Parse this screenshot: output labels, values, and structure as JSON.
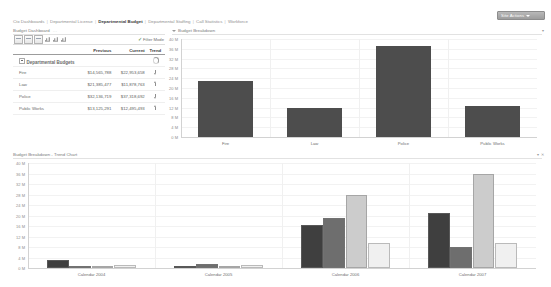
{
  "window": {
    "site_actions_label": "Site Actions",
    "site_actions_icon": "chevron-down-icon"
  },
  "breadcrumb": {
    "items": [
      {
        "label": "Ctx Dashboards",
        "active": false
      },
      {
        "label": "Departmental License",
        "active": false
      },
      {
        "label": "Departmental Budget",
        "active": true
      },
      {
        "label": "Departmental Staffing",
        "active": false
      },
      {
        "label": "Call Statistics",
        "active": false
      },
      {
        "label": "Workforce",
        "active": false
      }
    ],
    "separator": "|"
  },
  "panels": {
    "dashboard": {
      "title": "Budget Dashboard",
      "dots": "..."
    },
    "breakdown": {
      "title": "Budget Breakdown",
      "dots": "..."
    },
    "trend": {
      "title": "Budget Breakdown - Trend Chart",
      "dots": "..."
    }
  },
  "toolbar": {
    "icons": [
      "save-icon",
      "export-icon",
      "print-icon",
      "refresh-icon",
      "edit-icon",
      "chart-icon"
    ],
    "filter_mode_label": "Filter Mode",
    "filter_mode_checked": true,
    "filter_check_glyph": "✓"
  },
  "table": {
    "columns": [
      "",
      "Previous",
      "Current",
      "Trend"
    ],
    "group_row": {
      "label": "Departmental Budgets",
      "previous": "",
      "current": "",
      "trend": "loading-spinner-icon"
    },
    "rows": [
      {
        "name": "Fire",
        "previous": "$14,565,788",
        "current": "$22,953,658",
        "trend": "down"
      },
      {
        "name": "Law",
        "previous": "$21,385,477",
        "current": "$11,878,763",
        "trend": "up"
      },
      {
        "name": "Police",
        "previous": "$32,136,719",
        "current": "$37,318,692",
        "trend": "down"
      },
      {
        "name": "Public Works",
        "previous": "$13,125,291",
        "current": "$12,495,493",
        "trend": "up"
      }
    ]
  },
  "chart_data": [
    {
      "type": "bar",
      "id": "budget-breakdown",
      "title": "Budget Breakdown",
      "categories": [
        "Fire",
        "Law",
        "Police",
        "Public Works"
      ],
      "values": [
        22.95,
        11.88,
        37.32,
        12.5
      ],
      "series": [
        {
          "name": "Current",
          "values": [
            22.95,
            11.88,
            37.32,
            12.5
          ],
          "color": "#4d4d4d"
        }
      ],
      "xlabel": "",
      "ylabel": "",
      "ylim": [
        0,
        40
      ],
      "yticks": [
        0,
        4,
        8,
        12,
        16,
        20,
        24,
        28,
        32,
        36,
        40
      ],
      "ytick_labels": [
        "0 M",
        "4 M",
        "8 M",
        "12 M",
        "16 M",
        "20 M",
        "24 M",
        "28 M",
        "32 M",
        "36 M",
        "40 M"
      ],
      "grid": true,
      "legend": false
    },
    {
      "type": "bar",
      "id": "budget-trend",
      "title": "Budget Breakdown - Trend Chart",
      "categories": [
        "Calendar 2004",
        "Calendar 2005",
        "Calendar 2006",
        "Calendar 2007"
      ],
      "series": [
        {
          "name": "Fire",
          "color": "#3f3f3f",
          "values": [
            3.0,
            0.0,
            16.5,
            21.0
          ]
        },
        {
          "name": "Law",
          "color": "#6e6e6e",
          "values": [
            0.4,
            1.7,
            19.0,
            8.0
          ]
        },
        {
          "name": "Police",
          "color": "#cccccc",
          "values": [
            0.2,
            0.0,
            28.0,
            36.0
          ]
        },
        {
          "name": "Public Works",
          "color": "#f0f0f0",
          "values": [
            1.2,
            1.2,
            9.5,
            9.5
          ]
        }
      ],
      "xlabel": "",
      "ylabel": "",
      "ylim": [
        0,
        40
      ],
      "yticks": [
        0,
        4,
        8,
        12,
        16,
        20,
        24,
        28,
        32,
        36,
        40
      ],
      "ytick_labels": [
        "0 M",
        "4 M",
        "8 M",
        "12 M",
        "16 M",
        "20 M",
        "24 M",
        "28 M",
        "32 M",
        "36 M",
        "40 M"
      ],
      "grid": true,
      "legend": false
    }
  ],
  "colors": {
    "series_dark": "#3f3f3f",
    "series_mid": "#6e6e6e",
    "series_light": "#cccccc",
    "series_pale": "#f0f0f0",
    "bar_main": "#4d4d4d",
    "text": "#6f6f6f",
    "muted": "#9a9a9a"
  }
}
